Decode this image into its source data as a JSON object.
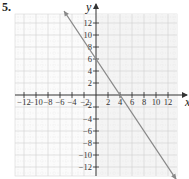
{
  "problem": {
    "number": "5."
  },
  "chart_data": {
    "type": "line",
    "title": "",
    "xlabel": "x",
    "ylabel": "y",
    "xlim": [
      -13.5,
      13.5
    ],
    "ylim": [
      -13.5,
      13.5
    ],
    "grid": true,
    "grid_step": 2,
    "x_ticks": [
      -12,
      -10,
      -8,
      -6,
      -4,
      -2,
      2,
      4,
      6,
      8,
      10,
      12
    ],
    "y_ticks": [
      12,
      10,
      8,
      6,
      4,
      2,
      -2,
      -4,
      -6,
      -8,
      -10,
      -12
    ],
    "x_tick_labels": [
      "−12",
      "−10",
      "−8",
      "−6",
      "−4",
      "−2",
      "2",
      "4",
      "6",
      "8",
      "10",
      "12"
    ],
    "y_tick_labels": [
      "12",
      "10",
      "8",
      "6",
      "4",
      "2",
      "−2",
      "−4",
      "−6",
      "−8",
      "−10",
      "−12"
    ],
    "series": [
      {
        "name": "y = -3/2 x + 6",
        "slope": -1.5,
        "intercept": 6,
        "x": [
          -5.33,
          13.33
        ],
        "y": [
          14,
          -14
        ],
        "arrows": "both",
        "color": "#888888"
      }
    ],
    "intercepts": {
      "x_intercept": 4,
      "y_intercept": 6
    }
  }
}
